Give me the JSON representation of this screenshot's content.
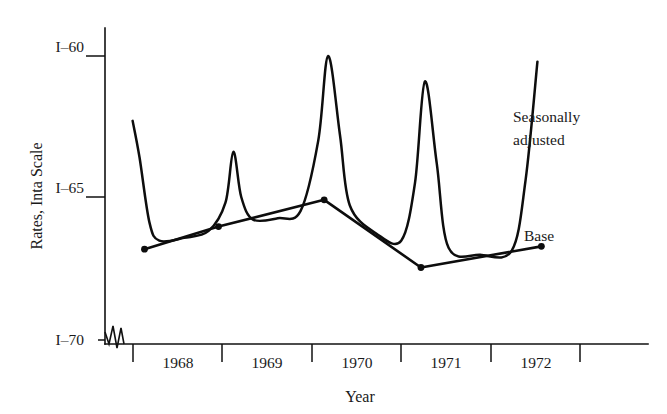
{
  "chart_data": {
    "type": "line",
    "title": "",
    "xlabel": "Year",
    "ylabel": "Rates, Inta Scale",
    "grid": false,
    "legend_position": "inline-annotations",
    "y_axis": {
      "tick_labels": [
        "I–60",
        "I–65",
        "I–70"
      ],
      "tick_values": [
        60,
        65,
        70
      ],
      "inverted": true,
      "axis_break": true,
      "axis_break_note": "zigzag break symbol just above I–70 at origin"
    },
    "x_axis": {
      "tick_labels": [
        "1968",
        "1969",
        "1970",
        "1971",
        "1972"
      ],
      "tick_values": [
        1968,
        1969,
        1970,
        1971,
        1972
      ],
      "range": [
        1967.5,
        1973.0
      ]
    },
    "annotations": [
      {
        "text": "Seasonally adjusted",
        "lines": [
          "Seasonally",
          "adjusted"
        ],
        "target_series": "seasonal"
      },
      {
        "text": "Base",
        "lines": [
          "Base"
        ],
        "target_series": "base"
      }
    ],
    "series": [
      {
        "name": "Seasonally adjusted",
        "style": "smooth-curve",
        "description": "Volatile curve with sharp seasonal spikes each year, riding above the base line",
        "points": [
          {
            "x": 1967.78,
            "y": 62.3
          },
          {
            "x": 1967.85,
            "y": 63.6
          },
          {
            "x": 1967.95,
            "y": 65.9
          },
          {
            "x": 1968.05,
            "y": 66.55
          },
          {
            "x": 1968.3,
            "y": 66.45
          },
          {
            "x": 1968.55,
            "y": 66.2
          },
          {
            "x": 1968.72,
            "y": 65.2
          },
          {
            "x": 1968.8,
            "y": 63.4
          },
          {
            "x": 1968.88,
            "y": 65.0
          },
          {
            "x": 1969.0,
            "y": 65.8
          },
          {
            "x": 1969.25,
            "y": 65.75
          },
          {
            "x": 1969.48,
            "y": 65.5
          },
          {
            "x": 1969.66,
            "y": 63.0
          },
          {
            "x": 1969.76,
            "y": 60.0
          },
          {
            "x": 1969.88,
            "y": 62.8
          },
          {
            "x": 1969.98,
            "y": 65.3
          },
          {
            "x": 1970.25,
            "y": 66.3
          },
          {
            "x": 1970.5,
            "y": 66.55
          },
          {
            "x": 1970.64,
            "y": 64.5
          },
          {
            "x": 1970.74,
            "y": 60.9
          },
          {
            "x": 1970.86,
            "y": 63.8
          },
          {
            "x": 1970.98,
            "y": 66.8
          },
          {
            "x": 1971.3,
            "y": 67.05
          },
          {
            "x": 1971.62,
            "y": 66.9
          },
          {
            "x": 1971.76,
            "y": 64.4
          },
          {
            "x": 1971.88,
            "y": 60.2
          }
        ]
      },
      {
        "name": "Base",
        "style": "straight-segments",
        "description": "Smooth underlying trend line with vertex markers",
        "points": [
          {
            "x": 1967.9,
            "y": 66.85,
            "marker": true
          },
          {
            "x": 1968.65,
            "y": 66.05,
            "marker": true
          },
          {
            "x": 1969.72,
            "y": 65.1,
            "marker": true
          },
          {
            "x": 1970.7,
            "y": 67.5,
            "marker": true
          },
          {
            "x": 1971.92,
            "y": 66.75,
            "marker": true
          }
        ]
      }
    ]
  },
  "axis": {
    "y_title": "Rates, Inta Scale",
    "x_title": "Year",
    "y_tick_0": "I–60",
    "y_tick_1": "I–65",
    "y_tick_2": "I–70",
    "x_tick_0": "1968",
    "x_tick_1": "1969",
    "x_tick_2": "1970",
    "x_tick_3": "1971",
    "x_tick_4": "1972"
  },
  "annotations": {
    "seasonal_line1": "Seasonally",
    "seasonal_line2": "adjusted",
    "base_label": "Base"
  },
  "colors": {
    "ink": "#0d0d0d",
    "background": "#ffffff"
  }
}
